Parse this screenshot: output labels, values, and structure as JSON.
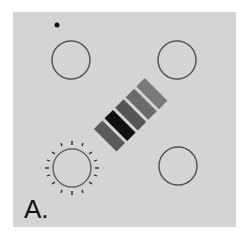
{
  "figure": {
    "panel_label": "A.",
    "background_color": "#d4d4d4",
    "elements": {
      "dot": {
        "cx": 57,
        "cy": 25,
        "r": 2.5
      },
      "circles": [
        {
          "name": "top-left",
          "cx": 71,
          "cy": 60,
          "r": 19,
          "highlighted": false
        },
        {
          "name": "top-right",
          "cx": 177,
          "cy": 60,
          "r": 19,
          "highlighted": false
        },
        {
          "name": "bottom-left",
          "cx": 72,
          "cy": 168,
          "r": 19,
          "highlighted": true
        },
        {
          "name": "bottom-right",
          "cx": 178,
          "cy": 166,
          "r": 19,
          "highlighted": false
        }
      ],
      "bars": [
        {
          "shade": "#5a5a5a"
        },
        {
          "shade": "#111111"
        },
        {
          "shade": "#555555"
        },
        {
          "shade": "#6a6a6a"
        },
        {
          "shade": "#7a7a7a"
        }
      ]
    }
  }
}
